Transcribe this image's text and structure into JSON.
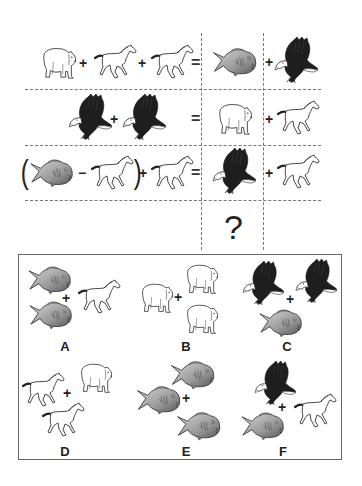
{
  "puzzle": {
    "equations": [
      {
        "left": [
          "bear",
          "+",
          "horse",
          "+",
          "horse"
        ],
        "equals": "=",
        "right": [
          "fish",
          "+",
          "eagle"
        ]
      },
      {
        "left": [
          "eagle",
          "+",
          "eagle"
        ],
        "equals": "=",
        "right": [
          "bear",
          "+",
          "horse"
        ]
      },
      {
        "left": [
          "(",
          "fish",
          "-",
          "horse",
          ")",
          "+",
          "horse"
        ],
        "equals": "=",
        "right": [
          "eagle",
          "+",
          "horse"
        ]
      }
    ],
    "question_mark": "?",
    "symbols": {
      "plus": "+",
      "minus": "−",
      "equals": "=",
      "open_paren": "(",
      "close_paren": ")"
    }
  },
  "options": [
    {
      "label": "A",
      "items": [
        "fish",
        "fish",
        "horse"
      ]
    },
    {
      "label": "B",
      "items": [
        "bear",
        "bear",
        "bear"
      ]
    },
    {
      "label": "C",
      "items": [
        "eagle",
        "eagle",
        "fish"
      ]
    },
    {
      "label": "D",
      "items": [
        "horse",
        "horse",
        "bear"
      ]
    },
    {
      "label": "E",
      "items": [
        "fish",
        "fish",
        "fish"
      ]
    },
    {
      "label": "F",
      "items": [
        "eagle",
        "fish",
        "horse"
      ]
    }
  ],
  "icons": {
    "bear": "polar-bear-icon",
    "horse": "horse-icon",
    "fish": "piranha-fish-icon",
    "eagle": "eagle-icon"
  },
  "colors": {
    "line": "#777777",
    "fish_light": "#c8c8c8",
    "fish_dark": "#555555",
    "eagle": "#1e1e1e",
    "outline": "#333333"
  }
}
